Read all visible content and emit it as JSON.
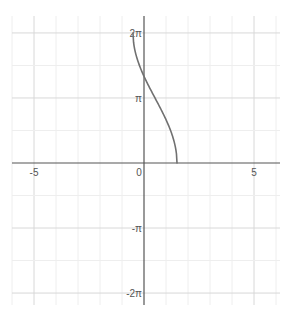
{
  "chart_data": {
    "type": "line",
    "title": "",
    "xlabel": "",
    "ylabel": "",
    "xlim": [
      -5.2,
      6.2
    ],
    "ylim": [
      -6.9,
      7.2
    ],
    "grid": true,
    "x_ticks": [
      {
        "value": -5,
        "label": "-5"
      },
      {
        "value": 0,
        "label": "0"
      },
      {
        "value": 5,
        "label": "5"
      }
    ],
    "y_ticks": [
      {
        "value": 6.2832,
        "label": "2π"
      },
      {
        "value": 3.1416,
        "label": "π"
      },
      {
        "value": -3.1416,
        "label": "-π"
      },
      {
        "value": -6.2832,
        "label": "-2π"
      }
    ],
    "series": [
      {
        "name": "curve",
        "color": "#707070",
        "description": "y = 2·arccos(x − 0.5), x ∈ [−0.5, 1.5]",
        "x": [
          -0.5,
          -0.45,
          -0.4,
          -0.3,
          -0.2,
          -0.1,
          0.0,
          0.1,
          0.2,
          0.3,
          0.4,
          0.5,
          0.6,
          0.7,
          0.8,
          0.9,
          1.0,
          1.1,
          1.2,
          1.3,
          1.4,
          1.45,
          1.5
        ],
        "y": [
          6.283,
          5.918,
          5.767,
          5.535,
          5.34,
          5.166,
          4.189,
          3.855,
          3.526,
          3.2,
          2.941,
          3.142,
          2.941,
          2.739,
          2.532,
          2.319,
          2.094,
          1.855,
          1.591,
          1.287,
          0.902,
          0.636,
          0.0
        ]
      }
    ]
  }
}
